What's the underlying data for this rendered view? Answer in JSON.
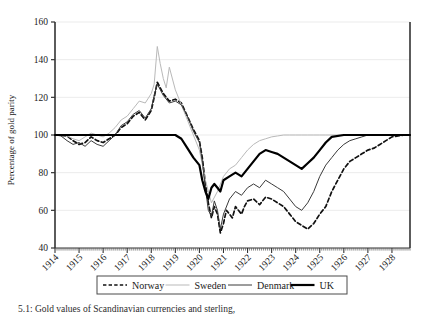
{
  "figure": {
    "caption": "5.1: Gold values of Scandinavian currencies and sterling,"
  },
  "legend": {
    "position": "bottom-center",
    "entries": [
      {
        "label": "Norway",
        "style": "dashed",
        "color": "#111111",
        "width": 1.6
      },
      {
        "label": "Sweden",
        "style": "solid",
        "color": "#b9b9b9",
        "width": 1.0
      },
      {
        "label": "Denmark",
        "style": "solid",
        "color": "#3a3a3a",
        "width": 1.0
      },
      {
        "label": "UK",
        "style": "solid",
        "color": "#000000",
        "width": 2.2
      }
    ]
  },
  "chart_data": {
    "type": "line",
    "title": "",
    "xlabel": "",
    "ylabel": "Percentage of gold parity",
    "xlim": [
      1914.0,
      1928.75
    ],
    "ylim": [
      40,
      160
    ],
    "yticks": [
      40,
      60,
      80,
      100,
      120,
      140,
      160
    ],
    "xticks": [
      1914,
      1915,
      1916,
      1917,
      1918,
      1919,
      1920,
      1921,
      1922,
      1923,
      1924,
      1925,
      1926,
      1927,
      1928
    ],
    "xtick_labels": [
      "1914",
      "1915",
      "1916",
      "1917",
      "1918",
      "1919",
      "1920",
      "1921",
      "1922",
      "1923",
      "1924",
      "1925",
      "1926",
      "1927",
      "1928"
    ],
    "xtick_rotation": 45,
    "minor_xticks_per_year": 12,
    "grid": "horizontal-light",
    "gridline_color": "#e6e6e6",
    "series": [
      {
        "name": "Norway",
        "style": "dashed",
        "color": "#111111",
        "x": [
          1914.0,
          1914.25,
          1914.5,
          1914.75,
          1915.0,
          1915.25,
          1915.5,
          1915.75,
          1916.0,
          1916.25,
          1916.5,
          1916.75,
          1917.0,
          1917.25,
          1917.5,
          1917.75,
          1918.0,
          1918.12,
          1918.25,
          1918.5,
          1918.75,
          1919.0,
          1919.25,
          1919.5,
          1919.75,
          1920.0,
          1920.12,
          1920.25,
          1920.37,
          1920.5,
          1920.62,
          1920.75,
          1920.87,
          1921.0,
          1921.12,
          1921.25,
          1921.37,
          1921.5,
          1921.62,
          1921.75,
          1921.87,
          1922.0,
          1922.25,
          1922.5,
          1922.75,
          1923.0,
          1923.25,
          1923.5,
          1923.75,
          1924.0,
          1924.25,
          1924.5,
          1924.75,
          1925.0,
          1925.25,
          1925.5,
          1925.75,
          1926.0,
          1926.25,
          1926.5,
          1926.75,
          1927.0,
          1927.25,
          1927.5,
          1927.75,
          1928.0,
          1928.5,
          1928.75
        ],
        "y": [
          100,
          99.8,
          99.5,
          97,
          95,
          96,
          99,
          97,
          96,
          98,
          100,
          104,
          106,
          110,
          112,
          108,
          113,
          120,
          128,
          122,
          118,
          119,
          117,
          110,
          103,
          97,
          88,
          74,
          64,
          56,
          62,
          58,
          48,
          53,
          60,
          58,
          56,
          62,
          60,
          58,
          62,
          65,
          66,
          63,
          67,
          66,
          64,
          62,
          58,
          54,
          52,
          50,
          53,
          58,
          62,
          70,
          76,
          82,
          86,
          88,
          90,
          92,
          93,
          95,
          97,
          99,
          100,
          100
        ]
      },
      {
        "name": "Sweden",
        "style": "solid",
        "color": "#b9b9b9",
        "x": [
          1914.0,
          1914.25,
          1914.5,
          1914.75,
          1915.0,
          1915.25,
          1915.5,
          1915.75,
          1916.0,
          1916.25,
          1916.5,
          1916.75,
          1917.0,
          1917.25,
          1917.5,
          1917.75,
          1918.0,
          1918.12,
          1918.25,
          1918.37,
          1918.5,
          1918.62,
          1918.75,
          1919.0,
          1919.25,
          1919.5,
          1919.75,
          1920.0,
          1920.25,
          1920.5,
          1920.75,
          1921.0,
          1921.25,
          1921.5,
          1921.75,
          1922.0,
          1922.25,
          1922.5,
          1922.75,
          1923.0,
          1923.25,
          1923.5,
          1923.75,
          1924.0,
          1924.25,
          1924.5,
          1924.75,
          1925.0,
          1925.25,
          1925.5,
          1925.75,
          1926.0,
          1926.5,
          1927.0,
          1927.5,
          1928.0,
          1928.75
        ],
        "y": [
          100,
          99.8,
          99.5,
          98,
          97,
          99,
          101,
          100,
          99,
          101,
          104,
          108,
          110,
          114,
          118,
          117,
          122,
          127,
          147,
          138,
          130,
          125,
          136,
          124,
          116,
          108,
          100,
          92,
          76,
          64,
          70,
          78,
          82,
          84,
          88,
          92,
          95,
          97,
          98,
          99,
          99.5,
          100,
          100,
          100,
          100,
          100,
          100,
          100,
          100,
          100,
          100,
          100,
          100,
          100,
          100,
          100,
          100
        ]
      },
      {
        "name": "Denmark",
        "style": "solid",
        "color": "#3a3a3a",
        "x": [
          1914.0,
          1914.25,
          1914.5,
          1914.75,
          1915.0,
          1915.25,
          1915.5,
          1915.75,
          1916.0,
          1916.25,
          1916.5,
          1916.75,
          1917.0,
          1917.25,
          1917.5,
          1917.75,
          1918.0,
          1918.12,
          1918.25,
          1918.5,
          1918.75,
          1919.0,
          1919.25,
          1919.5,
          1919.75,
          1920.0,
          1920.12,
          1920.25,
          1920.37,
          1920.5,
          1920.62,
          1920.75,
          1920.87,
          1921.0,
          1921.25,
          1921.5,
          1921.75,
          1922.0,
          1922.25,
          1922.5,
          1922.75,
          1923.0,
          1923.25,
          1923.5,
          1923.75,
          1924.0,
          1924.25,
          1924.5,
          1924.75,
          1925.0,
          1925.25,
          1925.5,
          1925.75,
          1926.0,
          1926.25,
          1926.5,
          1926.75,
          1927.0,
          1927.5,
          1928.0,
          1928.75
        ],
        "y": [
          100,
          99.5,
          97,
          95,
          96,
          94,
          97,
          95,
          94,
          97,
          100,
          105,
          107,
          111,
          113,
          109,
          114,
          121,
          127,
          121,
          117,
          118,
          116,
          110,
          102,
          96,
          86,
          72,
          60,
          57,
          65,
          60,
          50,
          58,
          66,
          70,
          68,
          72,
          74,
          72,
          76,
          74,
          72,
          70,
          66,
          62,
          60,
          64,
          70,
          78,
          84,
          88,
          92,
          95,
          97,
          98,
          99,
          100,
          100,
          100,
          100
        ]
      },
      {
        "name": "UK",
        "style": "solid",
        "color": "#000000",
        "x": [
          1914.0,
          1914.5,
          1915.0,
          1915.5,
          1916.0,
          1916.5,
          1917.0,
          1917.5,
          1918.0,
          1918.5,
          1919.0,
          1919.25,
          1919.5,
          1919.75,
          1920.0,
          1920.12,
          1920.25,
          1920.37,
          1920.5,
          1920.62,
          1920.75,
          1920.87,
          1921.0,
          1921.25,
          1921.5,
          1921.75,
          1922.0,
          1922.25,
          1922.5,
          1922.75,
          1923.0,
          1923.25,
          1923.5,
          1923.75,
          1924.0,
          1924.25,
          1924.5,
          1924.75,
          1925.0,
          1925.25,
          1925.5,
          1926.0,
          1926.5,
          1927.0,
          1927.5,
          1928.0,
          1928.75
        ],
        "y": [
          100,
          100,
          100,
          100,
          100,
          100,
          100,
          100,
          100,
          100,
          100,
          98,
          93,
          88,
          84,
          76,
          70,
          66,
          72,
          74,
          72,
          70,
          76,
          78,
          80,
          78,
          82,
          86,
          90,
          92,
          91,
          90,
          88,
          86,
          84,
          82,
          85,
          88,
          92,
          96,
          99,
          100,
          100,
          100,
          100,
          100,
          100
        ]
      }
    ]
  }
}
